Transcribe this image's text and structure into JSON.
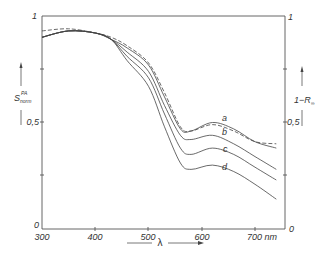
{
  "chart_data": {
    "type": "line",
    "title": "",
    "xlabel": "λ",
    "x_unit": "nm",
    "ylabel_left": "S_norm^PA",
    "ylabel_right": "1−R∞",
    "xlim": [
      300,
      750
    ],
    "ylim": [
      0,
      1
    ],
    "x_ticks": [
      "300",
      "400",
      "500",
      "600",
      "700 nm"
    ],
    "y_ticks_left": [
      "0",
      "0,5",
      "1"
    ],
    "y_ticks_right": [
      "0",
      "0,5",
      "1"
    ],
    "grid": false,
    "legend": "curve labels a, b, c, d placed inline; dashed curve is 1−R∞",
    "x": [
      300,
      350,
      400,
      430,
      460,
      500,
      530,
      560,
      580,
      620,
      660,
      700,
      740
    ],
    "series": [
      {
        "name": "1−R∞",
        "style": "dashed",
        "values": [
          0.93,
          0.94,
          0.92,
          0.9,
          0.86,
          0.78,
          0.64,
          0.48,
          0.46,
          0.49,
          0.46,
          0.41,
          0.4
        ]
      },
      {
        "name": "a",
        "style": "solid",
        "values": [
          0.9,
          0.93,
          0.92,
          0.89,
          0.85,
          0.77,
          0.62,
          0.47,
          0.46,
          0.5,
          0.47,
          0.41,
          0.38
        ]
      },
      {
        "name": "b",
        "style": "solid",
        "values": [
          0.9,
          0.93,
          0.92,
          0.89,
          0.83,
          0.74,
          0.58,
          0.44,
          0.42,
          0.44,
          0.4,
          0.34,
          0.28
        ]
      },
      {
        "name": "c",
        "style": "solid",
        "values": [
          0.9,
          0.93,
          0.92,
          0.89,
          0.81,
          0.71,
          0.54,
          0.38,
          0.35,
          0.38,
          0.35,
          0.29,
          0.23
        ]
      },
      {
        "name": "d",
        "style": "solid",
        "values": [
          0.9,
          0.93,
          0.92,
          0.89,
          0.79,
          0.67,
          0.48,
          0.31,
          0.28,
          0.3,
          0.27,
          0.21,
          0.14
        ]
      }
    ]
  },
  "labels": {
    "y_left_main": "S",
    "y_left_sup": "PA",
    "y_left_sub": "norm",
    "y_right": "1−R",
    "y_right_sub": "∞",
    "x_axis": "λ",
    "tick_0": "0",
    "tick_05": "0,5",
    "tick_1": "1",
    "x300": "300",
    "x400": "400",
    "x500": "500",
    "x600": "600",
    "x700": "700 nm",
    "curve_a": "a",
    "curve_b": "b",
    "curve_c": "c",
    "curve_d": "d"
  },
  "colors": {
    "line": "#444444",
    "axis": "#555555"
  }
}
